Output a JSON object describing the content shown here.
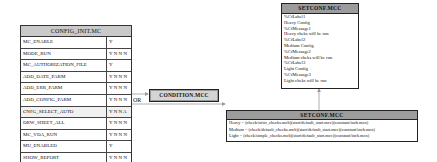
{
  "config_table": {
    "title": "CONFIG_INIT.MC",
    "rows": [
      {
        "key": "MC_ENABLE",
        "value": "Y"
      },
      {
        "key": "MODE_RUN",
        "value": "Y N N N"
      },
      {
        "key": "MC_AUTHORIZATION_FILE",
        "value": "Y"
      },
      {
        "key": "ADD_DATE_PARM",
        "value": "Y N N N"
      },
      {
        "key": "ADD_ERR_PARM",
        "value": "Y N N N"
      },
      {
        "key": "ADD_CONFIG_PARM",
        "value": "Y N N N"
      },
      {
        "key": "CNFG_SELECT_AUTO",
        "value": "Y N N A"
      },
      {
        "key": "DRW_SHEET_ALL",
        "value": "Y N N N"
      },
      {
        "key": "MC_VDA_RUN",
        "value": "Y N N N"
      },
      {
        "key": "MU_ENABLED",
        "value": "Y"
      },
      {
        "key": "SHOW_REPORT",
        "value": "Y N N N"
      }
    ]
  },
  "connector_label": "OR",
  "condition_box": {
    "title": "CONDITION.MCC"
  },
  "setconf_top": {
    "title": "SETCONF.MCC",
    "lines": [
      "%CfLabel1",
      "Heavy Config",
      "%CfMessage1",
      "Heavy cheks will be run",
      "%CfLabel2",
      "Medium Config",
      "%CfMessage2",
      "Medium cheks will be run",
      "%CfLabel3",
      "Light Config",
      "%CfMessage3",
      "Light cheks will be run"
    ]
  },
  "setconf_bottom": {
    "title": "SETCONF.MCC",
    "lines": [
      "Heavy = (check/strict_checks.mch)(start/default_start.mcc)(constant/inch.mcn)",
      "Medium = (check/default_checks.mch)(start/default_start.mcc)(constant/inch.mcn)",
      "Light = (check/simple_checks.mch)(start/default_start.mcc)(constant/inch.mcn)"
    ]
  },
  "colors": {
    "header_gray": "#9c9c9c",
    "table_header": "#c9c9c9",
    "connector": "#9a9a9a"
  }
}
